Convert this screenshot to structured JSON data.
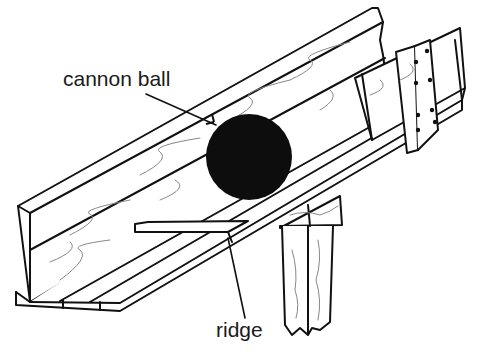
{
  "figure": {
    "colors": {
      "ink": "#111111",
      "grain": "#888888",
      "background": "#ffffff",
      "ball": "#0d0d0d"
    }
  },
  "labels": {
    "cannon_ball": "cannon ball",
    "ridge": "ridge"
  }
}
